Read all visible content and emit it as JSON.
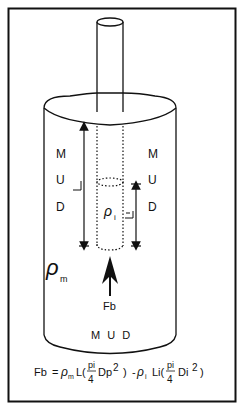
{
  "diagram": {
    "mud_left": [
      "M",
      "U",
      "D"
    ],
    "mud_right": [
      "M",
      "U",
      "D"
    ],
    "mud_bottom": "M U D",
    "length_outer": "L",
    "length_inner": "Li",
    "density_inner": "ρ",
    "density_inner_sub": "i",
    "density_mud": "ρ",
    "density_mud_sub": "m",
    "force_label": "Fb",
    "equation": {
      "lhs": "Fb",
      "equals": "=",
      "rho_m": "ρ",
      "rho_m_sub": "m",
      "term1_L": "L(",
      "frac1_num": "pi",
      "frac1_den": "4",
      "term1_var": "Dp",
      "term1_exp": "2",
      "term1_close": ")",
      "minus": "-",
      "rho_i": "ρ",
      "rho_i_sub": "i",
      "term2_L": "Li(",
      "frac2_num": "pi",
      "frac2_den": "4",
      "term2_var": "Di",
      "term2_exp": "2",
      "term2_close": ")"
    },
    "colors": {
      "line": "#111111",
      "background": "#ffffff"
    }
  }
}
